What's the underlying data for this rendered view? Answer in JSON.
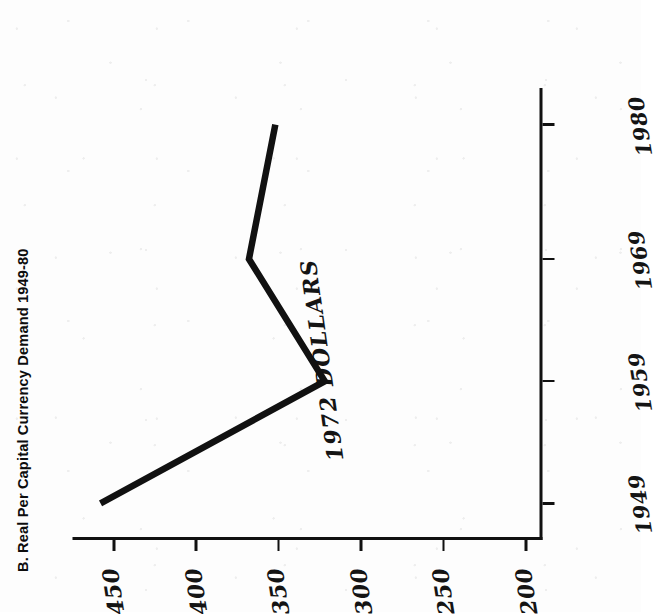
{
  "chart_data": {
    "type": "line",
    "title": "B. Real Per Capital Currency Demand 1949-80",
    "xlabel": "",
    "ylabel": "1972 DOLLARS",
    "x": [
      1949,
      1959,
      1969,
      1980
    ],
    "xtick_labels": [
      "1949",
      "1959",
      "1969",
      "1980"
    ],
    "values": [
      458,
      322,
      368,
      352
    ],
    "ytick_labels": [
      "200",
      "250",
      "300",
      "350",
      "400",
      "450"
    ],
    "yticks": [
      200,
      250,
      300,
      350,
      400,
      450
    ],
    "ylim": [
      190,
      475
    ],
    "xlim": [
      1946,
      1983
    ],
    "grid": false,
    "legend": false,
    "series": [
      {
        "name": "Real Per Capital Currency Demand",
        "values": [
          458,
          322,
          368,
          352
        ]
      }
    ],
    "line_color": "#111111",
    "annotations": []
  },
  "figure": {
    "panel_label": "B.",
    "title_text": "B. Real Per Capital Currency Demand 1949-80",
    "axis_title_y": "1972 DOLLARS",
    "orientation": "rotated-90-ccw",
    "background_color": "#fdfdfd",
    "ink_color": "#111111"
  }
}
